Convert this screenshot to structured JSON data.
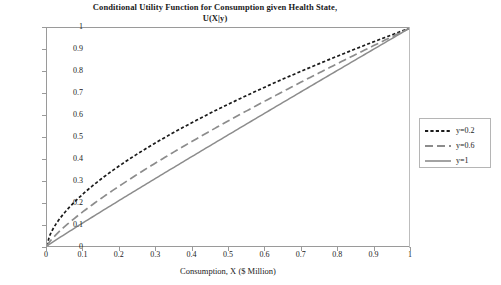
{
  "chart_data": {
    "type": "line",
    "title": "Conditional Utility Function for Consumption given Health State,",
    "subtitle": "U(X|y)",
    "xlabel": "Consumption, X ($ Million)",
    "ylabel": "",
    "xlim": [
      0,
      1
    ],
    "ylim": [
      0,
      1
    ],
    "grid": false,
    "legend_position": "right",
    "xticks": [
      "0",
      "0.1",
      "0.2",
      "0.3",
      "0.4",
      "0.5",
      "0.6",
      "0.7",
      "0.8",
      "0.9",
      "1"
    ],
    "yticks": [
      "0",
      "0.1",
      "0.2",
      "0.3",
      "0.4",
      "0.5",
      "0.6",
      "0.7",
      "0.8",
      "0.9",
      "1"
    ],
    "x": [
      0,
      0.05,
      0.1,
      0.15,
      0.2,
      0.25,
      0.3,
      0.35,
      0.4,
      0.45,
      0.5,
      0.55,
      0.6,
      0.65,
      0.7,
      0.75,
      0.8,
      0.85,
      0.9,
      0.95,
      1
    ],
    "series": [
      {
        "name": "y=0.2",
        "style": "dotted",
        "color": "#1a1a1a",
        "exponent": 0.62,
        "values": [
          0,
          0.154,
          0.237,
          0.302,
          0.365,
          0.42,
          0.465,
          0.513,
          0.561,
          0.6,
          0.651,
          0.685,
          0.723,
          0.758,
          0.793,
          0.827,
          0.861,
          0.894,
          0.926,
          0.958,
          1
        ]
      },
      {
        "name": "y=0.6",
        "style": "dashed",
        "color": "#8c8c8c",
        "exponent": 0.8,
        "values": [
          0,
          0.091,
          0.158,
          0.219,
          0.275,
          0.33,
          0.382,
          0.432,
          0.48,
          0.527,
          0.574,
          0.619,
          0.663,
          0.707,
          0.75,
          0.793,
          0.835,
          0.876,
          0.917,
          0.959,
          1
        ]
      },
      {
        "name": "y=1",
        "style": "solid",
        "color": "#8c8c8c",
        "exponent": 0.97,
        "values": [
          0,
          0.053,
          0.104,
          0.155,
          0.205,
          0.255,
          0.305,
          0.354,
          0.403,
          0.452,
          0.5,
          0.549,
          0.597,
          0.645,
          0.693,
          0.741,
          0.789,
          0.837,
          0.885,
          0.942,
          1
        ]
      }
    ]
  },
  "legend": {
    "entries": [
      {
        "label": "y=0.2"
      },
      {
        "label": "y=0.6"
      },
      {
        "label": "y=1"
      }
    ]
  }
}
